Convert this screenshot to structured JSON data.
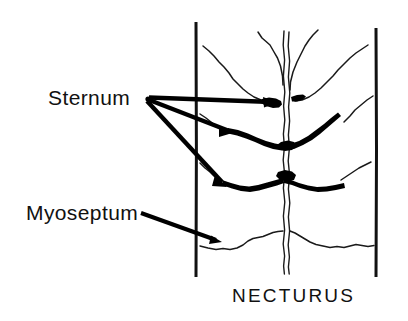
{
  "figure": {
    "species_label": "NECTURUS",
    "background_color": "#ffffff",
    "ink_color": "#000000",
    "width": 408,
    "height": 321
  },
  "labels": [
    {
      "id": "sternum",
      "text": "Sternum",
      "x": 48,
      "y": 105,
      "pointer_count": 3
    },
    {
      "id": "myoseptum",
      "text": "Myoseptum",
      "x": 26,
      "y": 220,
      "pointer_count": 1
    }
  ],
  "species": {
    "text": "NECTURUS",
    "x": 232,
    "y": 302
  },
  "anatomy": {
    "left_border_label": "left-body-margin",
    "right_border_label": "right-body-margin",
    "midline_label": "linea-alba-midline",
    "myoseptum_label": "myoseptum",
    "sternum_label": "sternum-ossification"
  }
}
